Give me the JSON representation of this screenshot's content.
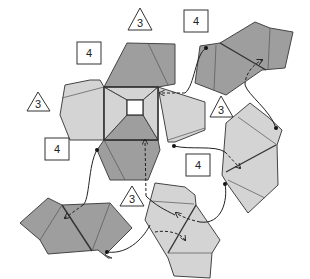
{
  "diagram": {
    "labels": {
      "tri_top": "3",
      "tri_left": "3",
      "tri_right": "3",
      "tri_bottom": "3",
      "sq_top_left": "4",
      "sq_top_right": "4",
      "sq_left": "4",
      "sq_center_right": "4"
    },
    "colors": {
      "dark_unit": "#9e9e9e",
      "light_unit": "#d4d4d4",
      "outline": "#444444",
      "background": "#ffffff"
    }
  }
}
